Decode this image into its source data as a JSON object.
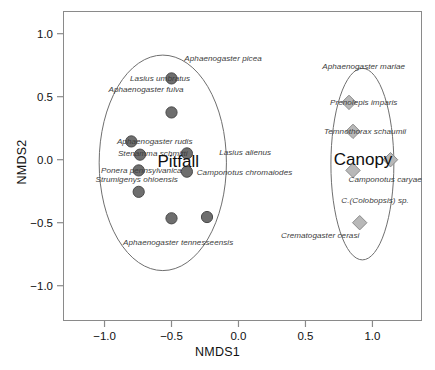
{
  "chart_data": {
    "type": "scatter",
    "title": "",
    "xlabel": "NMDS1",
    "ylabel": "NMDS2",
    "xlim": [
      -1.31,
      1.37
    ],
    "ylim": [
      -1.28,
      1.18
    ],
    "xticks": [
      "−1.0",
      "−0.5",
      "0.0",
      "0.5",
      "1.0"
    ],
    "xtick_values": [
      -1.0,
      -0.5,
      0.0,
      0.5,
      1.0
    ],
    "yticks": [
      "1.0",
      "0.5",
      "0.0",
      "−0.5",
      "−1.0"
    ],
    "ytick_values": [
      1.0,
      0.5,
      0.0,
      -0.5,
      -1.0
    ],
    "grid": false,
    "legend": "none",
    "group_labels": [
      {
        "text": "Pitfall",
        "x": -0.45,
        "y": -0.02
      },
      {
        "text": "Canopy",
        "x": 0.93,
        "y": 0.0
      }
    ],
    "series": [
      {
        "name": "Pitfall",
        "marker": "circle",
        "color": "#6e6e6e",
        "edge_color": "#4a4a4a",
        "points": [
          {
            "x": -0.5,
            "y": 0.645
          },
          {
            "x": -0.5,
            "y": 0.375
          },
          {
            "x": -0.8,
            "y": 0.145
          },
          {
            "x": -0.735,
            "y": 0.04
          },
          {
            "x": -0.385,
            "y": 0.05
          },
          {
            "x": -0.745,
            "y": -0.085
          },
          {
            "x": -0.385,
            "y": -0.095
          },
          {
            "x": -0.745,
            "y": -0.255
          },
          {
            "x": -0.5,
            "y": -0.465
          },
          {
            "x": -0.235,
            "y": -0.455
          }
        ],
        "ellipse": {
          "cx": -0.565,
          "cy": -0.025,
          "rx": 0.475,
          "ry": 0.855
        }
      },
      {
        "name": "Canopy",
        "marker": "diamond",
        "color": "#b8b8b8",
        "edge_color": "#8c8c8c",
        "points": [
          {
            "x": 0.825,
            "y": 0.455
          },
          {
            "x": 0.855,
            "y": 0.225
          },
          {
            "x": 1.135,
            "y": 0.0
          },
          {
            "x": 0.855,
            "y": -0.085
          },
          {
            "x": 0.905,
            "y": -0.5
          }
        ],
        "ellipse": {
          "cx": 0.925,
          "cy": -0.035,
          "rx": 0.235,
          "ry": 0.76
        }
      }
    ],
    "annotations": [
      {
        "text": "Aphaenogaster picea",
        "x": -0.115,
        "y": 0.805,
        "anchor": "middle"
      },
      {
        "text": "Lasius umbratus",
        "x": -0.585,
        "y": 0.65,
        "anchor": "middle"
      },
      {
        "text": "Aphaenogaster fulva",
        "x": -0.69,
        "y": 0.565,
        "anchor": "middle"
      },
      {
        "text": "Aphaenogaster rudis",
        "x": -0.625,
        "y": 0.15,
        "anchor": "middle"
      },
      {
        "text": "Stenamma schmitti",
        "x": -0.64,
        "y": 0.055,
        "anchor": "middle"
      },
      {
        "text": "Lasius alienus",
        "x": 0.05,
        "y": 0.06,
        "anchor": "middle"
      },
      {
        "text": "Ponera pennsylvanica",
        "x": -0.725,
        "y": -0.085,
        "anchor": "middle"
      },
      {
        "text": "Camponotus chromaiodes",
        "x": 0.045,
        "y": -0.1,
        "anchor": "middle"
      },
      {
        "text": "Strumigenys ohioensis",
        "x": -0.76,
        "y": -0.15,
        "anchor": "middle"
      },
      {
        "text": "Aphaenogaster tennesseensis",
        "x": -0.45,
        "y": -0.65,
        "anchor": "middle"
      },
      {
        "text": "Aphaenogaster mariae",
        "x": 0.935,
        "y": 0.745,
        "anchor": "middle"
      },
      {
        "text": "Prenolepis imparis",
        "x": 0.935,
        "y": 0.46,
        "anchor": "middle"
      },
      {
        "text": "Temnothorax schaumii",
        "x": 0.945,
        "y": 0.225,
        "anchor": "middle"
      },
      {
        "text": "Camponotus caryae",
        "x": 1.095,
        "y": -0.155,
        "anchor": "middle"
      },
      {
        "text": "C.(Colobopsis) sp.",
        "x": 1.02,
        "y": -0.32,
        "anchor": "middle"
      },
      {
        "text": "Crematogaster cerasi",
        "x": 0.61,
        "y": -0.595,
        "anchor": "middle"
      }
    ]
  }
}
